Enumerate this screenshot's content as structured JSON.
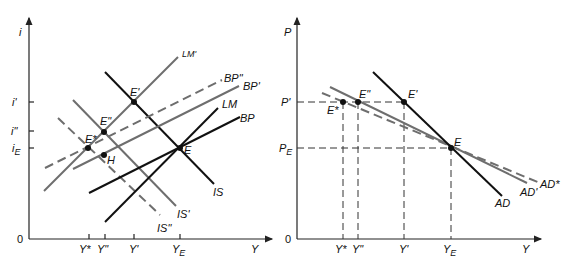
{
  "left_panel": {
    "y_axis_label": "i",
    "x_axis_label": "Y",
    "origin_label": "0",
    "y_ticks": [
      "i'",
      "i\"",
      "iE"
    ],
    "x_ticks": [
      "Y*",
      "Y\"",
      "Y'",
      "YE"
    ],
    "curves": {
      "IS": "IS",
      "IS_prime": "IS'",
      "IS_dprime": "IS\"",
      "LM": "LM",
      "LM_prime": "LM'",
      "BP": "BP",
      "BP_prime": "BP'",
      "BP_dprime": "BP\""
    },
    "points": {
      "E": "E",
      "E_prime": "E'",
      "E_dprime": "E\"",
      "E_star": "E*",
      "H": "H"
    }
  },
  "right_panel": {
    "y_axis_label": "P",
    "x_axis_label": "Y",
    "origin_label": "0",
    "y_ticks": [
      "P'",
      "PE"
    ],
    "x_ticks": [
      "Y*",
      "Y\"",
      "Y'",
      "YE"
    ],
    "curves": {
      "AD": "AD",
      "AD_prime": "AD'",
      "AD_star": "AD*"
    },
    "points": {
      "E": "E",
      "E_prime": "E'",
      "E_dprime": "E\"",
      "E_star": "E*"
    }
  },
  "colors": {
    "ink": "#111111",
    "gray_curve": "#6e6e6e",
    "background": "#ffffff"
  }
}
